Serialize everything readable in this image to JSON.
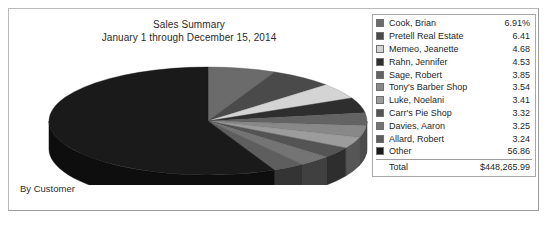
{
  "report": {
    "title": "Sales Summary",
    "subtitle": "January 1 through December 15, 2014",
    "footer_label": "By Customer"
  },
  "legend": {
    "total_label": "Total",
    "total_value": "$448,265.99",
    "items": [
      {
        "label": "Cook, Brian",
        "value": "6.91%",
        "color": "#6b6b6b"
      },
      {
        "label": "Pretell Real Estate",
        "value": "6.41",
        "color": "#4a4a4a"
      },
      {
        "label": "Memeo, Jeanette",
        "value": "4.68",
        "color": "#d4d4d4"
      },
      {
        "label": "Rahn, Jennifer",
        "value": "4.53",
        "color": "#2e2e2e"
      },
      {
        "label": "Sage, Robert",
        "value": "3.85",
        "color": "#636363"
      },
      {
        "label": "Tony's Barber Shop",
        "value": "3.54",
        "color": "#888888"
      },
      {
        "label": "Luke, Noelani",
        "value": "3.41",
        "color": "#9c9c9c"
      },
      {
        "label": "Carr's Pie Shop",
        "value": "3.32",
        "color": "#545454"
      },
      {
        "label": "Davies, Aaron",
        "value": "3.25",
        "color": "#747474"
      },
      {
        "label": "Allard, Robert",
        "value": "3.24",
        "color": "#5e5e5e"
      },
      {
        "label": "Other",
        "value": "56.86",
        "color": "#1a1a1a"
      }
    ]
  },
  "chart_data": {
    "type": "pie",
    "title": "Sales Summary",
    "subtitle": "January 1 through December 15, 2014",
    "xlabel": "",
    "ylabel": "",
    "legend_position": "right",
    "grid": false,
    "unit": "percent",
    "total": "$448,265.99",
    "style": "3d-pie",
    "categories": [
      "Cook, Brian",
      "Pretell Real Estate",
      "Memeo, Jeanette",
      "Rahn, Jennifer",
      "Sage, Robert",
      "Tony's Barber Shop",
      "Luke, Noelani",
      "Carr's Pie Shop",
      "Davies, Aaron",
      "Allard, Robert",
      "Other"
    ],
    "values": [
      6.91,
      6.41,
      4.68,
      4.53,
      3.85,
      3.54,
      3.41,
      3.32,
      3.25,
      3.24,
      56.86
    ],
    "colors": [
      "#6b6b6b",
      "#4a4a4a",
      "#d4d4d4",
      "#2e2e2e",
      "#636363",
      "#888888",
      "#9c9c9c",
      "#545454",
      "#747474",
      "#5e5e5e",
      "#1a1a1a"
    ],
    "geometry": {
      "cx": 166,
      "cy": 66,
      "rx": 159,
      "ry": 54,
      "depth": 28,
      "start_angle_deg": 270
    }
  }
}
